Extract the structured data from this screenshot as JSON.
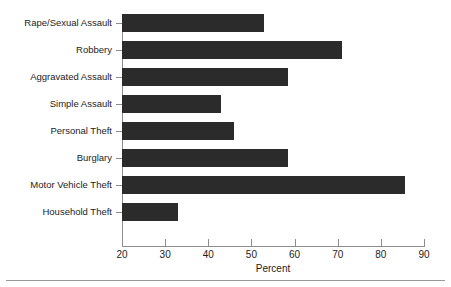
{
  "chart_data": {
    "type": "bar",
    "orientation": "horizontal",
    "title": "",
    "xlabel": "Percent",
    "ylabel": "",
    "xlim": [
      20,
      90
    ],
    "xticks": [
      20,
      30,
      40,
      50,
      60,
      70,
      80,
      90
    ],
    "grid": false,
    "legend": null,
    "bar_color": "#2b2b2b",
    "axis_color": "#8d8d8d",
    "categories": [
      "Rape/Sexual Assault",
      "Robbery",
      "Aggravated Assault",
      "Simple Assault",
      "Personal Theft",
      "Burglary",
      "Motor Vehicle Theft",
      "Household Theft"
    ],
    "values": [
      53,
      71,
      58.5,
      43,
      46,
      58.5,
      85.5,
      33
    ]
  }
}
